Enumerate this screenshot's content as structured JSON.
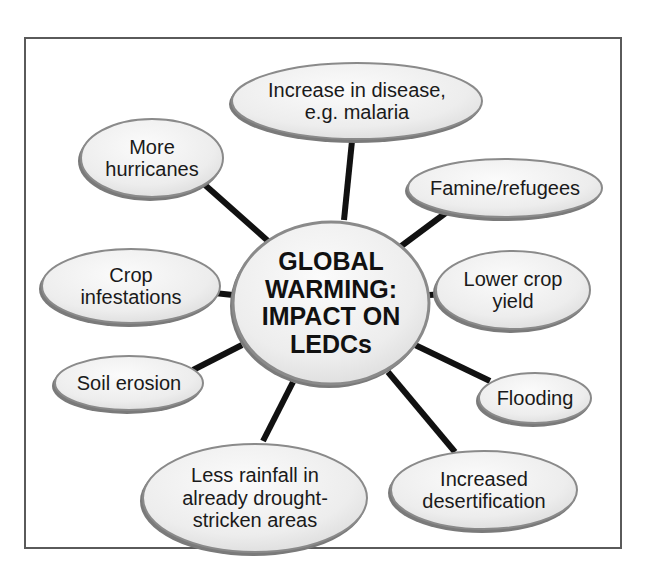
{
  "diagram": {
    "type": "mind-map",
    "colors": {
      "frame_border": "#5a5a5a",
      "connector": "#111111",
      "node_fill": "#eeeeee",
      "node_fill_highlight": "#fbfbfb",
      "node_border": "#8a8a8a",
      "node_shadow": "#7a7a7a",
      "text": "#1a1a1a"
    },
    "center": {
      "label": "GLOBAL\nWARMING:\nIMPACT ON\nLEDCs",
      "cx": 331,
      "cy": 303,
      "rx": 99,
      "ry": 82
    },
    "nodes": [
      {
        "id": "disease",
        "label": "Increase in disease,\ne.g. malaria",
        "cx": 357,
        "cy": 101,
        "rx": 126,
        "ry": 39,
        "link_from": [
          344,
          220
        ],
        "link_to": [
          352,
          141
        ]
      },
      {
        "id": "hurricanes",
        "label": "More\nhurricanes",
        "cx": 152,
        "cy": 158,
        "rx": 72,
        "ry": 40,
        "link_from": [
          268,
          241
        ],
        "link_to": [
          205,
          185
        ]
      },
      {
        "id": "famine",
        "label": "Famine/refugees",
        "cx": 505,
        "cy": 188,
        "rx": 98,
        "ry": 30,
        "link_from": [
          400,
          247
        ],
        "link_to": [
          447,
          212
        ]
      },
      {
        "id": "crop-infestations",
        "label": "Crop\ninfestations",
        "cx": 131,
        "cy": 286,
        "rx": 90,
        "ry": 38,
        "link_from": [
          233,
          295
        ],
        "link_to": [
          205,
          292
        ]
      },
      {
        "id": "lower-crop-yield",
        "label": "Lower crop\nyield",
        "cx": 513,
        "cy": 290,
        "rx": 78,
        "ry": 40,
        "link_from": [
          429,
          295
        ],
        "link_to": [
          448,
          294
        ]
      },
      {
        "id": "soil-erosion",
        "label": "Soil erosion",
        "cx": 129,
        "cy": 383,
        "rx": 75,
        "ry": 28,
        "link_from": [
          242,
          345
        ],
        "link_to": [
          193,
          370
        ]
      },
      {
        "id": "flooding",
        "label": "Flooding",
        "cx": 535,
        "cy": 398,
        "rx": 57,
        "ry": 26,
        "link_from": [
          413,
          344
        ],
        "link_to": [
          490,
          381
        ]
      },
      {
        "id": "less-rainfall",
        "label": "Less rainfall in\nalready drought-\nstricken areas",
        "cx": 255,
        "cy": 498,
        "rx": 113,
        "ry": 55,
        "link_from": [
          293,
          382
        ],
        "link_to": [
          263,
          441
        ]
      },
      {
        "id": "desertification",
        "label": "Increased\ndesertification",
        "cx": 484,
        "cy": 490,
        "rx": 94,
        "ry": 40,
        "link_from": [
          388,
          372
        ],
        "link_to": [
          455,
          452
        ]
      }
    ]
  }
}
